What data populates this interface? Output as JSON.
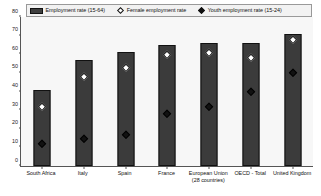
{
  "legend": {
    "items": [
      {
        "label": "Employment rate (15-64)",
        "marker": "bar-swatch",
        "color": "#3f3f3f"
      },
      {
        "label": "Female employment rate",
        "marker": "white-diamond-icon",
        "color": "#ffffff"
      },
      {
        "label": "Youth employment rate (15-24)",
        "marker": "black-diamond-icon",
        "color": "#111111"
      }
    ]
  },
  "chart_data": {
    "type": "bar",
    "title": "",
    "xlabel": "",
    "ylabel": "",
    "ylim": [
      0,
      80
    ],
    "yticks": [
      0,
      10,
      20,
      30,
      40,
      50,
      60,
      70,
      80
    ],
    "grid": false,
    "legend_position": "top",
    "categories": [
      "South Africa",
      "Italy",
      "Spain",
      "France",
      "European Union (28 countries)",
      "OECD - Total",
      "United Kingdom"
    ],
    "series": [
      {
        "name": "Employment rate (15-64)",
        "type": "bar",
        "values": [
          41,
          57,
          61,
          65,
          66,
          66,
          71
        ]
      },
      {
        "name": "Female employment rate",
        "type": "scatter",
        "values": [
          32,
          48,
          53,
          60,
          61,
          58,
          68
        ]
      },
      {
        "name": "Youth employment rate (15-24)",
        "type": "scatter",
        "values": [
          12,
          15,
          17,
          28,
          32,
          40,
          50
        ]
      }
    ]
  }
}
